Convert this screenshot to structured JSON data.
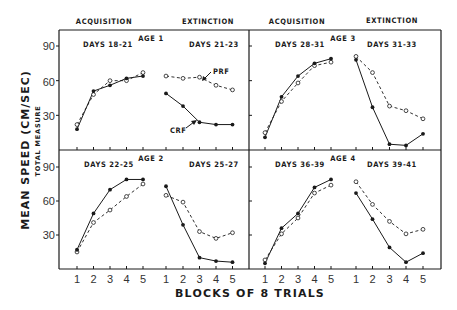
{
  "chart_data": {
    "type": "line",
    "title": "",
    "xlabel": "BLOCKS OF 8 TRIALS",
    "ylabel": "MEAN SPEED (CM/SEC)",
    "ylabel_sub": "TOTAL MEASURE",
    "ylim": [
      0,
      100
    ],
    "yticks": [
      30,
      60,
      90
    ],
    "x": [
      1,
      2,
      3,
      4,
      5
    ],
    "phase_headers": [
      "ACQUISITION",
      "EXTINCTION",
      "ACQUISITION",
      "EXTINCTION"
    ],
    "grid": false,
    "legend": {
      "position": "annotation in Age 1 extinction panel",
      "entries": [
        "PRF",
        "CRF"
      ]
    },
    "series_styles": {
      "CRF": {
        "line": "solid",
        "marker": "filled-circle"
      },
      "PRF": {
        "line": "dashed",
        "marker": "open-circle"
      }
    },
    "panels": [
      {
        "age_label": "AGE 1",
        "acquisition": {
          "days": "DAYS 18-21",
          "CRF": [
            18,
            51,
            56,
            62,
            64
          ],
          "PRF": [
            22,
            48,
            60,
            60,
            67
          ]
        },
        "extinction": {
          "days": "DAYS 21-23",
          "CRF": [
            49,
            38,
            24,
            22,
            22
          ],
          "PRF": [
            64,
            62,
            63,
            56,
            52
          ]
        }
      },
      {
        "age_label": "AGE 2",
        "acquisition": {
          "days": "DAYS 22-25",
          "CRF": [
            17,
            49,
            70,
            79,
            79
          ],
          "PRF": [
            15,
            41,
            52,
            64,
            75
          ]
        },
        "extinction": {
          "days": "DAYS 25-27",
          "CRF": [
            73,
            39,
            10,
            7,
            6
          ],
          "PRF": [
            65,
            59,
            33,
            27,
            32
          ]
        }
      },
      {
        "age_label": "AGE 3",
        "acquisition": {
          "days": "DAYS 28-31",
          "CRF": [
            11,
            46,
            64,
            75,
            79
          ],
          "PRF": [
            15,
            42,
            58,
            73,
            76
          ]
        },
        "extinction": {
          "days": "DAYS 31-33",
          "CRF": [
            78,
            37,
            5,
            4,
            14
          ],
          "PRF": [
            81,
            67,
            38,
            34,
            27
          ]
        }
      },
      {
        "age_label": "AGE 4",
        "acquisition": {
          "days": "DAYS 36-39",
          "CRF": [
            5,
            36,
            49,
            72,
            79
          ],
          "PRF": [
            8,
            31,
            45,
            67,
            74
          ]
        },
        "extinction": {
          "days": "DAYS 39-41",
          "CRF": [
            67,
            44,
            19,
            6,
            14
          ],
          "PRF": [
            77,
            57,
            42,
            31,
            35
          ]
        }
      }
    ],
    "annotations": [
      {
        "text": "PRF",
        "panel": "AGE 1 extinction",
        "points_to": "PRF series"
      },
      {
        "text": "CRF",
        "panel": "AGE 1 extinction",
        "points_to": "CRF series"
      }
    ]
  },
  "colors": {
    "ink": "#1a1a1a",
    "tick_text": "#333333",
    "background": "#ffffff"
  }
}
